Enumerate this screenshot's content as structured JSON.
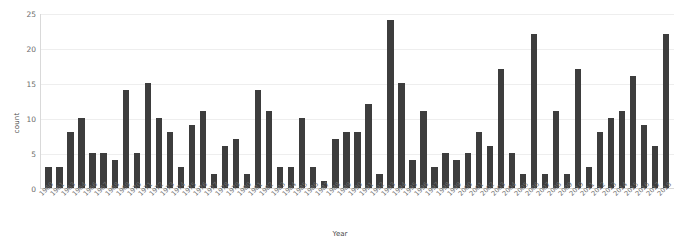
{
  "chart_data": {
    "type": "bar",
    "title": "",
    "xlabel": "Year",
    "ylabel": "count",
    "ylim": [
      0,
      25
    ],
    "yticks": [
      0,
      5,
      10,
      15,
      20,
      25
    ],
    "grid": true,
    "legend": "none",
    "bar_color": "#3d3d3d",
    "categories": [
      "1960",
      "1961",
      "1963",
      "1964",
      "1966",
      "1967",
      "1968",
      "1969",
      "1970",
      "1971",
      "1972",
      "1973",
      "1974",
      "1975",
      "1976",
      "1977",
      "1978",
      "1979",
      "1980",
      "1981",
      "1982",
      "1983",
      "1984",
      "1985",
      "1986",
      "1987",
      "1988",
      "1989",
      "1990",
      "1991",
      "1992",
      "1993",
      "1994",
      "1995",
      "1996",
      "1997",
      "1998",
      "1999",
      "2000",
      "2001",
      "2002",
      "2003",
      "2004",
      "2005",
      "2006",
      "2007",
      "2008",
      "2009",
      "2010",
      "2011",
      "2012",
      "2013",
      "2014",
      "2015",
      "2016",
      "2017",
      "2018"
    ],
    "values": [
      3,
      3,
      8,
      10,
      5,
      5,
      4,
      14,
      5,
      15,
      10,
      8,
      3,
      9,
      11,
      2,
      6,
      7,
      2,
      14,
      11,
      3,
      3,
      10,
      3,
      1,
      7,
      8,
      8,
      12,
      2,
      24,
      15,
      4,
      11,
      3,
      5,
      4,
      5,
      8,
      6,
      17,
      5,
      2,
      22,
      2,
      11,
      2,
      17,
      3,
      8,
      10,
      11,
      16,
      9,
      6,
      22
    ]
  }
}
